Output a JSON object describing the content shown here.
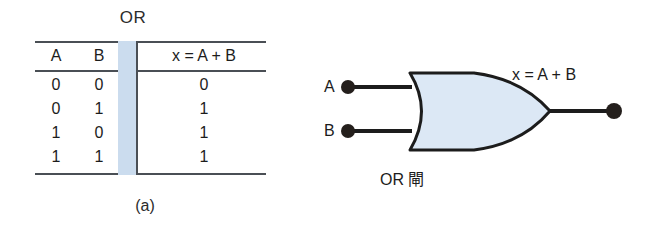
{
  "figure": {
    "panel_a": {
      "title": "OR",
      "caption": "(a)",
      "table": {
        "headers": [
          "A",
          "B",
          "x = A + B"
        ],
        "rows": [
          {
            "a": "0",
            "b": "0",
            "x": "0"
          },
          {
            "a": "0",
            "b": "1",
            "x": "1"
          },
          {
            "a": "1",
            "b": "0",
            "x": "1"
          },
          {
            "a": "1",
            "b": "1",
            "x": "1"
          }
        ]
      }
    },
    "panel_b": {
      "caption": "(b)",
      "input_labels": [
        "A",
        "B"
      ],
      "output_label": "x = A + B",
      "gate_name": "OR 閘",
      "symbol": "or-gate"
    },
    "colors": {
      "gate_fill": "#dce8f5",
      "separator_band": "#cbdcee",
      "line": "#1c1c1c",
      "rule": "#4a4f55",
      "background": "#ffffff"
    }
  }
}
